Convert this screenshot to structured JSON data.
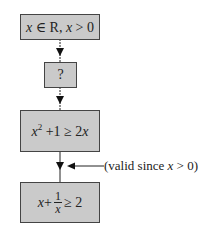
{
  "diagram": {
    "type": "flowchart",
    "nodes": [
      {
        "id": "premise",
        "text": "x ∈ R, x > 0"
      },
      {
        "id": "unknown",
        "text": "?"
      },
      {
        "id": "step",
        "text": "x^2 + 1 ≥ 2x"
      },
      {
        "id": "conclusion",
        "text": "x + 1/x ≥ 2"
      }
    ],
    "edges": [
      {
        "from": "premise",
        "to": "unknown"
      },
      {
        "from": "unknown",
        "to": "step"
      },
      {
        "from": "step",
        "to": "conclusion",
        "annotation": "(valid since x > 0)"
      }
    ],
    "labels": {
      "premise_x1": "x",
      "premise_in": " ∈ R, ",
      "premise_x2": "x",
      "premise_rest": " > 0",
      "unknown": "?",
      "step_x": "x",
      "step_exp": "2",
      "step_mid": " +1 ≥ 2",
      "step_x2": "x",
      "concl_x": "x",
      "concl_plus": "+",
      "concl_num": "1",
      "concl_den": "x",
      "concl_rest": "≥ 2",
      "note_pre": "(valid since ",
      "note_x": "x",
      "note_post": " > 0)"
    },
    "colors": {
      "box_fill": "#cacaca",
      "box_border": "#444444",
      "line": "#222222"
    }
  }
}
